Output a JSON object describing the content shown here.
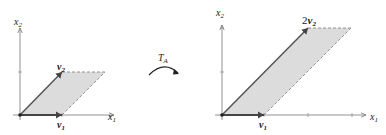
{
  "left_diagram": {
    "axis_x_label": "x",
    "axis_x_sub": "1",
    "axis_y_label": "x",
    "axis_y_sub": "2",
    "vector_1_label": "v",
    "vector_1_sub": "1",
    "vector_2_label": "v",
    "vector_2_sub": "2"
  },
  "transform": {
    "label": "T",
    "label_sub": "A"
  },
  "right_diagram": {
    "axis_x_label": "x",
    "axis_x_sub": "1",
    "axis_y_label": "x",
    "axis_y_sub": "2",
    "vector_1_label": "v",
    "vector_1_sub": "1",
    "vector_2_coef": "2",
    "vector_2_label": "v",
    "vector_2_sub": "2"
  },
  "colors": {
    "fill": "#dcdcdc",
    "vector": "#555555",
    "axis": "#777777",
    "dashed": "#888888"
  }
}
